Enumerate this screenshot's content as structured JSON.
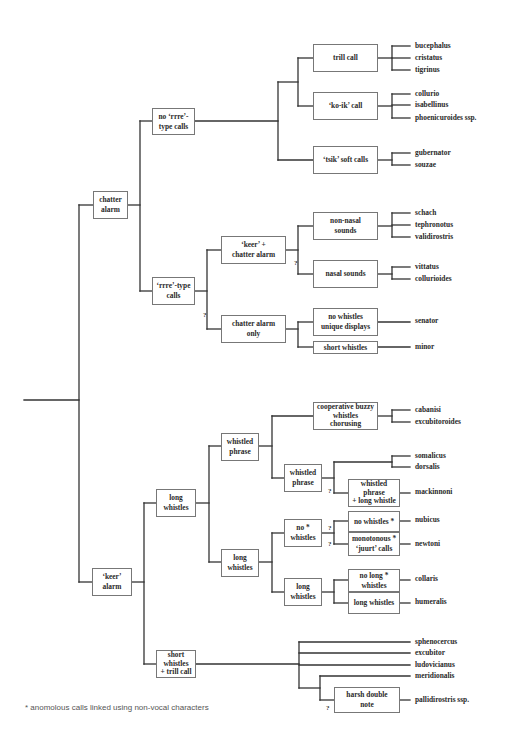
{
  "diagram": {
    "type": "classification-tree",
    "title": "",
    "line_color": "#333333",
    "box_border_color": "#777777",
    "footnote": "* anomolous calls linked using non-vocal characters",
    "nodes": [
      {
        "id": "chatter-alarm",
        "label": "chatter\nalarm",
        "x": 93,
        "y": 191,
        "w": 35,
        "h": 28
      },
      {
        "id": "no-rrre",
        "label": "no ‘rrre’-\ntype calls",
        "x": 152,
        "y": 108,
        "w": 43,
        "h": 27
      },
      {
        "id": "rrre",
        "label": "‘rrre’-type\ncalls",
        "x": 152,
        "y": 277,
        "w": 43,
        "h": 28
      },
      {
        "id": "trill-call",
        "label": "trill call",
        "x": 313,
        "y": 44,
        "w": 65,
        "h": 28
      },
      {
        "id": "ko-ik-call",
        "label": "‘ko-ik’ call",
        "x": 313,
        "y": 92,
        "w": 65,
        "h": 28
      },
      {
        "id": "tsik-soft",
        "label": "‘tsik’ soft calls",
        "x": 313,
        "y": 146,
        "w": 65,
        "h": 28
      },
      {
        "id": "keer-chatter",
        "label": "‘keer’ +\nchatter alarm",
        "x": 221,
        "y": 236,
        "w": 65,
        "h": 28
      },
      {
        "id": "chatter-only",
        "label": "chatter alarm\nonly",
        "x": 221,
        "y": 315,
        "w": 65,
        "h": 28
      },
      {
        "id": "non-nasal",
        "label": "non-nasal\nsounds",
        "x": 313,
        "y": 212,
        "w": 65,
        "h": 28
      },
      {
        "id": "nasal",
        "label": "nasal sounds",
        "x": 313,
        "y": 260,
        "w": 65,
        "h": 28
      },
      {
        "id": "no-whistles-unique",
        "label": "no whistles\nunique displays",
        "x": 313,
        "y": 308,
        "w": 65,
        "h": 28
      },
      {
        "id": "short-whistles-1",
        "label": "short whistles",
        "x": 313,
        "y": 341,
        "w": 65,
        "h": 13
      },
      {
        "id": "keer-alarm",
        "label": "‘keer’\nalarm",
        "x": 92,
        "y": 568,
        "w": 40,
        "h": 28
      },
      {
        "id": "long-whistles-1",
        "label": "long\nwhistles",
        "x": 156,
        "y": 489,
        "w": 40,
        "h": 28
      },
      {
        "id": "short-whistles-trill",
        "label": "short\nwhistles\n+ trill call",
        "x": 156,
        "y": 650,
        "w": 40,
        "h": 28
      },
      {
        "id": "whistled-phrase-1",
        "label": "whistled\nphrase",
        "x": 221,
        "y": 433,
        "w": 38,
        "h": 28
      },
      {
        "id": "long-whistles-2",
        "label": "long\nwhistles",
        "x": 221,
        "y": 549,
        "w": 38,
        "h": 28
      },
      {
        "id": "coop-buzzy",
        "label": "cooperative buzzy\nwhistles\nchorusing",
        "x": 313,
        "y": 402,
        "w": 65,
        "h": 28
      },
      {
        "id": "whistled-phrase-2",
        "label": "whistled\nphrase",
        "x": 284,
        "y": 464,
        "w": 38,
        "h": 28
      },
      {
        "id": "no-star-whistles",
        "label": "no *\nwhistles",
        "x": 284,
        "y": 519,
        "w": 38,
        "h": 28
      },
      {
        "id": "long-whistles-3",
        "label": "long\nwhistles",
        "x": 284,
        "y": 578,
        "w": 38,
        "h": 28
      },
      {
        "id": "wp-long-whistle",
        "label": "whistled\nphrase\n+ long whistle",
        "x": 348,
        "y": 479,
        "w": 52,
        "h": 28
      },
      {
        "id": "no-whistles-star",
        "label": "no whistles *",
        "x": 348,
        "y": 511,
        "w": 52,
        "h": 21
      },
      {
        "id": "monotonous-juurt",
        "label": "monotonous *\n‘juurt’ calls",
        "x": 348,
        "y": 532,
        "w": 52,
        "h": 24
      },
      {
        "id": "no-long-whistles",
        "label": "no long *\nwhistles",
        "x": 348,
        "y": 569,
        "w": 52,
        "h": 23
      },
      {
        "id": "long-whistles-4",
        "label": "long whistles",
        "x": 348,
        "y": 592,
        "w": 52,
        "h": 22
      },
      {
        "id": "harsh-double",
        "label": "harsh double\nnote",
        "x": 334,
        "y": 687,
        "w": 66,
        "h": 26
      }
    ],
    "leaves": [
      {
        "label": "bucephalus",
        "x": 415,
        "y": 46
      },
      {
        "label": "cristatus",
        "x": 415,
        "y": 58
      },
      {
        "label": "tigrinus",
        "x": 415,
        "y": 70
      },
      {
        "label": "collurio",
        "x": 415,
        "y": 94
      },
      {
        "label": "isabellinus",
        "x": 415,
        "y": 105
      },
      {
        "label": "phoenicuroides ssp.",
        "x": 415,
        "y": 118
      },
      {
        "label": "gubernator",
        "x": 415,
        "y": 153
      },
      {
        "label": "souzae",
        "x": 415,
        "y": 165
      },
      {
        "label": "schach",
        "x": 415,
        "y": 213
      },
      {
        "label": "tephronotus",
        "x": 415,
        "y": 225
      },
      {
        "label": "validirostris",
        "x": 415,
        "y": 237
      },
      {
        "label": "vittatus",
        "x": 415,
        "y": 267
      },
      {
        "label": "collurioides",
        "x": 415,
        "y": 279
      },
      {
        "label": "senator",
        "x": 415,
        "y": 321
      },
      {
        "label": "minor",
        "x": 415,
        "y": 347
      },
      {
        "label": "cabanisi",
        "x": 415,
        "y": 410
      },
      {
        "label": "excubitoroides",
        "x": 415,
        "y": 422
      },
      {
        "label": "somalicus",
        "x": 415,
        "y": 456
      },
      {
        "label": "dorsalis",
        "x": 415,
        "y": 467
      },
      {
        "label": "mackinnoni",
        "x": 415,
        "y": 492
      },
      {
        "label": "nubicus",
        "x": 415,
        "y": 520
      },
      {
        "label": "newtoni",
        "x": 415,
        "y": 544
      },
      {
        "label": "collaris",
        "x": 415,
        "y": 579
      },
      {
        "label": "humeralis",
        "x": 415,
        "y": 602
      },
      {
        "label": "sphenocercus",
        "x": 415,
        "y": 642
      },
      {
        "label": "excubitor",
        "x": 415,
        "y": 653
      },
      {
        "label": "ludovicianus",
        "x": 415,
        "y": 665
      },
      {
        "label": "meridionalis",
        "x": 415,
        "y": 676
      },
      {
        "label": "pallidirostris ssp.",
        "x": 415,
        "y": 700
      }
    ],
    "question_marks": [
      {
        "label": "?",
        "x": 203,
        "y": 311
      },
      {
        "label": "?",
        "x": 294,
        "y": 259
      },
      {
        "label": "?",
        "x": 328,
        "y": 487
      },
      {
        "label": "?",
        "x": 328,
        "y": 524
      },
      {
        "label": "?",
        "x": 328,
        "y": 540
      },
      {
        "label": "?",
        "x": 326,
        "y": 704
      }
    ],
    "edges": [
      [
        24,
        400,
        79,
        400
      ],
      [
        79,
        205,
        79,
        582
      ],
      [
        79,
        205,
        93,
        205
      ],
      [
        79,
        582,
        92,
        582
      ],
      [
        128,
        205,
        140,
        205
      ],
      [
        140,
        121,
        140,
        291
      ],
      [
        140,
        121,
        152,
        121
      ],
      [
        140,
        291,
        152,
        291
      ],
      [
        195,
        121,
        278,
        121
      ],
      [
        278,
        82,
        278,
        160
      ],
      [
        278,
        82,
        298,
        82
      ],
      [
        278,
        160,
        313,
        160
      ],
      [
        298,
        58,
        298,
        106
      ],
      [
        298,
        58,
        313,
        58
      ],
      [
        298,
        106,
        313,
        106
      ],
      [
        378,
        58,
        392,
        58
      ],
      [
        392,
        46,
        392,
        70
      ],
      [
        392,
        46,
        410,
        46
      ],
      [
        392,
        58,
        410,
        58
      ],
      [
        392,
        70,
        410,
        70
      ],
      [
        378,
        106,
        392,
        106
      ],
      [
        392,
        94,
        392,
        118
      ],
      [
        392,
        94,
        410,
        94
      ],
      [
        392,
        105,
        410,
        105
      ],
      [
        392,
        118,
        410,
        118
      ],
      [
        378,
        160,
        392,
        160
      ],
      [
        392,
        153,
        392,
        165
      ],
      [
        392,
        153,
        410,
        153
      ],
      [
        392,
        165,
        410,
        165
      ],
      [
        195,
        291,
        207,
        291
      ],
      [
        207,
        250,
        207,
        329
      ],
      [
        207,
        250,
        221,
        250
      ],
      [
        207,
        329,
        221,
        329
      ],
      [
        286,
        250,
        298,
        250
      ],
      [
        298,
        226,
        298,
        274
      ],
      [
        298,
        226,
        313,
        226
      ],
      [
        298,
        274,
        313,
        274
      ],
      [
        378,
        226,
        392,
        226
      ],
      [
        392,
        213,
        392,
        237
      ],
      [
        392,
        213,
        410,
        213
      ],
      [
        392,
        225,
        410,
        225
      ],
      [
        392,
        237,
        410,
        237
      ],
      [
        378,
        274,
        392,
        274
      ],
      [
        392,
        267,
        392,
        279
      ],
      [
        392,
        267,
        410,
        267
      ],
      [
        392,
        279,
        410,
        279
      ],
      [
        286,
        329,
        298,
        329
      ],
      [
        298,
        322,
        298,
        347
      ],
      [
        298,
        322,
        313,
        322
      ],
      [
        298,
        347,
        313,
        347
      ],
      [
        378,
        322,
        410,
        322
      ],
      [
        378,
        347,
        410,
        347
      ],
      [
        132,
        582,
        144,
        582
      ],
      [
        144,
        503,
        144,
        664
      ],
      [
        144,
        503,
        156,
        503
      ],
      [
        144,
        664,
        156,
        664
      ],
      [
        196,
        664,
        299,
        664
      ],
      [
        299,
        642,
        299,
        688
      ],
      [
        299,
        642,
        410,
        642
      ],
      [
        299,
        653,
        410,
        653
      ],
      [
        299,
        665,
        410,
        665
      ],
      [
        299,
        688,
        320,
        688
      ],
      [
        320,
        676,
        320,
        700
      ],
      [
        320,
        676,
        410,
        676
      ],
      [
        320,
        700,
        334,
        700
      ],
      [
        400,
        700,
        410,
        700
      ],
      [
        196,
        503,
        209,
        503
      ],
      [
        209,
        446,
        209,
        562
      ],
      [
        209,
        446,
        221,
        446
      ],
      [
        209,
        562,
        221,
        562
      ],
      [
        259,
        446,
        272,
        446
      ],
      [
        272,
        416,
        272,
        478
      ],
      [
        272,
        416,
        313,
        416
      ],
      [
        272,
        478,
        284,
        478
      ],
      [
        378,
        416,
        392,
        416
      ],
      [
        392,
        410,
        392,
        422
      ],
      [
        392,
        410,
        410,
        410
      ],
      [
        392,
        422,
        410,
        422
      ],
      [
        322,
        478,
        334,
        478
      ],
      [
        334,
        462,
        334,
        493
      ],
      [
        334,
        462,
        392,
        462
      ],
      [
        392,
        456,
        392,
        467
      ],
      [
        392,
        456,
        410,
        456
      ],
      [
        392,
        467,
        410,
        467
      ],
      [
        334,
        493,
        348,
        493
      ],
      [
        400,
        493,
        410,
        493
      ],
      [
        259,
        562,
        272,
        562
      ],
      [
        272,
        533,
        272,
        592
      ],
      [
        272,
        533,
        284,
        533
      ],
      [
        272,
        592,
        284,
        592
      ],
      [
        322,
        533,
        334,
        533
      ],
      [
        334,
        521,
        334,
        544
      ],
      [
        334,
        521,
        348,
        521
      ],
      [
        334,
        544,
        348,
        544
      ],
      [
        400,
        521,
        410,
        521
      ],
      [
        400,
        544,
        410,
        544
      ],
      [
        322,
        592,
        334,
        592
      ],
      [
        334,
        580,
        334,
        603
      ],
      [
        334,
        580,
        348,
        580
      ],
      [
        334,
        603,
        348,
        603
      ],
      [
        400,
        580,
        410,
        580
      ],
      [
        400,
        603,
        410,
        603
      ]
    ]
  }
}
